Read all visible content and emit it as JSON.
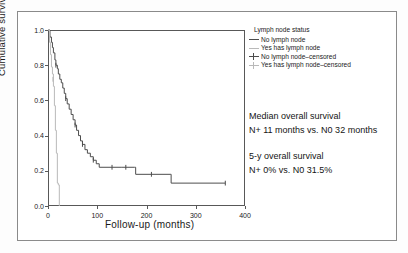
{
  "chart_data": {
    "type": "line",
    "plot_kind": "kaplan-meier-survival",
    "title": "",
    "xlabel": "Follow-up (months)",
    "ylabel": "Cumulative survival",
    "xlim": [
      0,
      400
    ],
    "ylim": [
      0.0,
      1.0
    ],
    "xticks": [
      0,
      100,
      200,
      300,
      400
    ],
    "xtick_labels": [
      "0",
      "100",
      "200",
      "300",
      "400"
    ],
    "yticks": [
      0.0,
      0.2,
      0.4,
      0.6,
      0.8,
      1.0
    ],
    "ytick_labels": [
      "0.0",
      "0.2",
      "0.4",
      "0.6",
      "0.8",
      "1.0"
    ],
    "grid": false,
    "legend_position": "right-top",
    "series": [
      {
        "name": "No lymph node",
        "color": "#4d4d4d",
        "points": [
          [
            0,
            1.0
          ],
          [
            4,
            0.96
          ],
          [
            7,
            0.93
          ],
          [
            9,
            0.9
          ],
          [
            11,
            0.87
          ],
          [
            14,
            0.83
          ],
          [
            16,
            0.8
          ],
          [
            19,
            0.78
          ],
          [
            21,
            0.75
          ],
          [
            24,
            0.72
          ],
          [
            27,
            0.7
          ],
          [
            30,
            0.67
          ],
          [
            33,
            0.64
          ],
          [
            36,
            0.61
          ],
          [
            39,
            0.58
          ],
          [
            43,
            0.55
          ],
          [
            47,
            0.52
          ],
          [
            51,
            0.49
          ],
          [
            55,
            0.46
          ],
          [
            58,
            0.43
          ],
          [
            62,
            0.4
          ],
          [
            66,
            0.37
          ],
          [
            70,
            0.35
          ],
          [
            75,
            0.32
          ],
          [
            80,
            0.3
          ],
          [
            86,
            0.28
          ],
          [
            92,
            0.26
          ],
          [
            98,
            0.24
          ],
          [
            104,
            0.22
          ],
          [
            150,
            0.22
          ],
          [
            176,
            0.22
          ],
          [
            178,
            0.18
          ],
          [
            248,
            0.18
          ],
          [
            250,
            0.13
          ],
          [
            360,
            0.13
          ]
        ],
        "censored_points": [
          [
            16,
            0.8
          ],
          [
            36,
            0.61
          ],
          [
            55,
            0.46
          ],
          [
            70,
            0.35
          ],
          [
            92,
            0.26
          ],
          [
            130,
            0.22
          ],
          [
            158,
            0.22
          ],
          [
            210,
            0.18
          ],
          [
            360,
            0.13
          ]
        ]
      },
      {
        "name": "Yes has lymph node",
        "color": "#b9b9b9",
        "points": [
          [
            0,
            1.0
          ],
          [
            3,
            0.93
          ],
          [
            5,
            0.86
          ],
          [
            7,
            0.79
          ],
          [
            9,
            0.75
          ],
          [
            11,
            0.68
          ],
          [
            13,
            0.57
          ],
          [
            15,
            0.43
          ],
          [
            17,
            0.3
          ],
          [
            19,
            0.13
          ],
          [
            21,
            0.12
          ],
          [
            23,
            0.0
          ]
        ],
        "censored_points": [
          [
            10,
            0.72
          ]
        ]
      }
    ]
  },
  "legend": {
    "title": "Lymph node status",
    "items": [
      {
        "label": "No lymph node",
        "symbol": "line-segment",
        "color": "#4d4d4d"
      },
      {
        "label": "Yes has lymph node",
        "symbol": "line-segment",
        "color": "#b9b9b9"
      },
      {
        "label": "No lymph node–censored",
        "symbol": "line-with-cross",
        "color": "#4d4d4d"
      },
      {
        "label": "Yes has lymph node–censored",
        "symbol": "line-with-cross",
        "color": "#b9b9b9"
      }
    ]
  },
  "annotations": {
    "median_heading": "Median overall survival",
    "median_value": "N+ 11 months vs. N0 32 months",
    "fiveyear_heading": "5-y overall survival",
    "fiveyear_value": "N+ 0% vs. N0 31.5%"
  }
}
